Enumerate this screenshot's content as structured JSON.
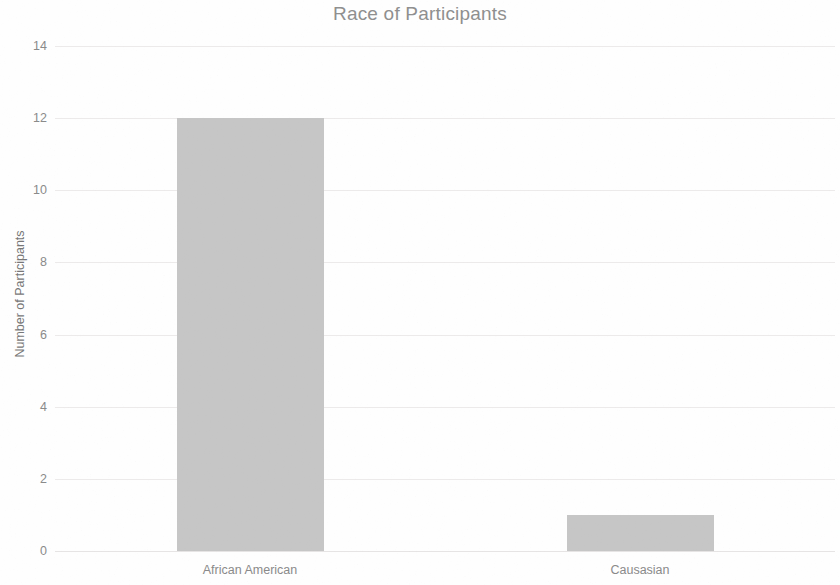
{
  "chart_data": {
    "type": "bar",
    "title": "Race of Participants",
    "xlabel": "",
    "ylabel": "Number of Participants",
    "categories": [
      "African American",
      "Causasian"
    ],
    "values": [
      12,
      1
    ],
    "series": [
      {
        "name": "Number of Participants",
        "values": [
          12,
          1
        ]
      }
    ],
    "ylim": [
      0,
      14
    ],
    "ytick_labels": [
      "0",
      "2",
      "4",
      "6",
      "8",
      "10",
      "12",
      "14"
    ],
    "ytick_values": [
      0,
      2,
      4,
      6,
      8,
      10,
      12,
      14
    ],
    "grid": true,
    "legend": "none",
    "bar_color": "#c6c6c6",
    "text_color": "#8a8a8a",
    "title_color": "#8f8f8f",
    "gridline_color": "#eceaea",
    "background_color": "#fefefe"
  }
}
